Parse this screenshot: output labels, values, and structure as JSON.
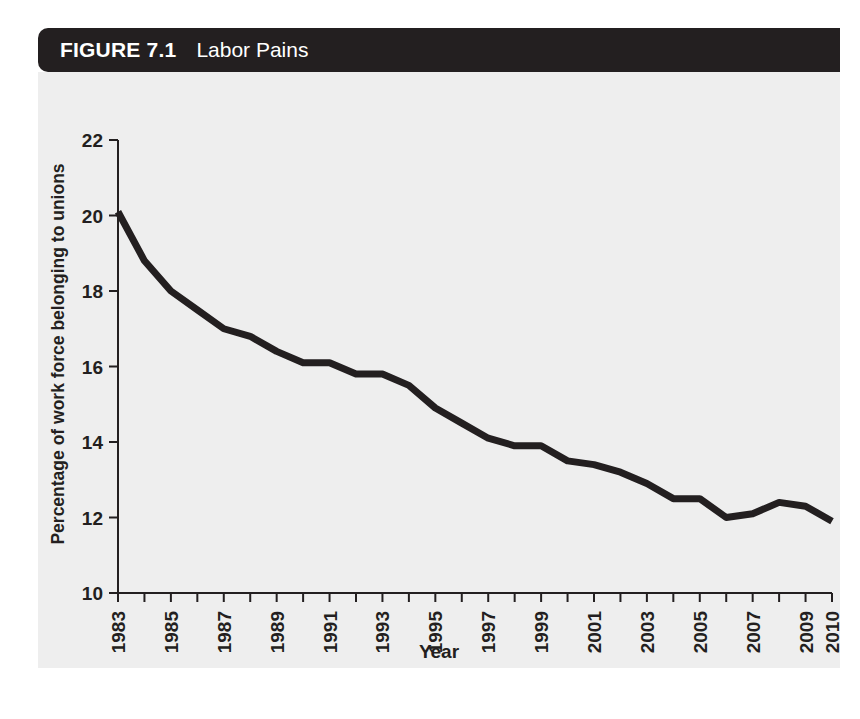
{
  "figure": {
    "number": "FIGURE 7.1",
    "title": "Labor Pains"
  },
  "colors": {
    "header_background": "#231f20",
    "header_text": "#ffffff",
    "panel_background": "#eeeeee",
    "line": "#231f20",
    "axis": "#231f20"
  },
  "chart_data": {
    "type": "line",
    "title": "Labor Pains",
    "xlabel": "Year",
    "ylabel": "Percentage of work force belonging to unions",
    "xlim": [
      1983,
      2010
    ],
    "ylim": [
      10,
      22
    ],
    "grid": false,
    "legend": false,
    "y_ticks": [
      10,
      12,
      14,
      16,
      18,
      20,
      22
    ],
    "y_tick_labels": [
      "10",
      "12",
      "14",
      "16",
      "18",
      "20",
      "22"
    ],
    "x_ticks": [
      1983,
      1984,
      1985,
      1986,
      1987,
      1988,
      1989,
      1990,
      1991,
      1992,
      1993,
      1994,
      1995,
      1996,
      1997,
      1998,
      1999,
      2000,
      2001,
      2002,
      2003,
      2004,
      2005,
      2006,
      2007,
      2008,
      2009,
      2010
    ],
    "x_tick_labels": [
      "1983",
      "1985",
      "1987",
      "1989",
      "1991",
      "1993",
      "1995",
      "1997",
      "1999",
      "2001",
      "2003",
      "2005",
      "2007",
      "2009",
      "2010"
    ],
    "x_tick_labels_years": [
      1983,
      1985,
      1987,
      1989,
      1991,
      1993,
      1995,
      1997,
      1999,
      2001,
      2003,
      2005,
      2007,
      2009,
      2010
    ],
    "x": [
      1983,
      1984,
      1985,
      1986,
      1987,
      1988,
      1989,
      1990,
      1991,
      1992,
      1993,
      1994,
      1995,
      1996,
      1997,
      1998,
      1999,
      2000,
      2001,
      2002,
      2003,
      2004,
      2005,
      2006,
      2007,
      2008,
      2009,
      2010
    ],
    "values": [
      20.1,
      18.8,
      18.0,
      17.5,
      17.0,
      16.8,
      16.4,
      16.1,
      16.1,
      15.8,
      15.8,
      15.5,
      14.9,
      14.5,
      14.1,
      13.9,
      13.9,
      13.5,
      13.4,
      13.2,
      12.9,
      12.5,
      12.5,
      12.0,
      12.1,
      12.4,
      12.3,
      11.9
    ],
    "series": [
      {
        "name": "Percentage of work force belonging to unions",
        "values": [
          20.1,
          18.8,
          18.0,
          17.5,
          17.0,
          16.8,
          16.4,
          16.1,
          16.1,
          15.8,
          15.8,
          15.5,
          14.9,
          14.5,
          14.1,
          13.9,
          13.9,
          13.5,
          13.4,
          13.2,
          12.9,
          12.5,
          12.5,
          12.0,
          12.1,
          12.4,
          12.3,
          11.9
        ]
      }
    ]
  }
}
